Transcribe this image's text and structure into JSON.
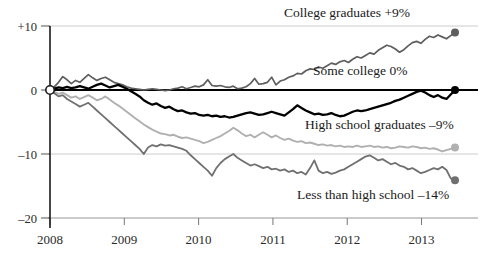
{
  "chart_data": {
    "type": "line",
    "title": "",
    "subtitle": "",
    "xlabel": "",
    "ylabel": "",
    "xlim": [
      2008.0,
      2013.45
    ],
    "ylim": [
      -20,
      10
    ],
    "grid": "horizontal-light",
    "legend_position": "inline-right",
    "zero_line": 0,
    "y_ticks": [
      {
        "value": 10,
        "label": "+10"
      },
      {
        "value": 0,
        "label": "0"
      },
      {
        "value": -10,
        "label": "–10"
      },
      {
        "value": -20,
        "label": "–20"
      }
    ],
    "x_ticks": [
      {
        "value": 2008,
        "label": "2008"
      },
      {
        "value": 2009,
        "label": "2009"
      },
      {
        "value": 2010,
        "label": "2010"
      },
      {
        "value": 2011,
        "label": "2011"
      },
      {
        "value": 2012,
        "label": "2012"
      },
      {
        "value": 2013,
        "label": "2013"
      }
    ],
    "series": [
      {
        "name": "College graduates",
        "label": "College graduates +9%",
        "end_value": 9,
        "end_value_label": "+9%",
        "color": "#5e5e5e",
        "width": 1.7,
        "label_x": 284,
        "label_y": 17,
        "values": [
          0.0,
          0.5,
          1.2,
          2.1,
          1.6,
          1.0,
          1.5,
          1.2,
          1.8,
          2.4,
          1.9,
          1.5,
          1.8,
          2.0,
          1.6,
          1.2,
          1.0,
          0.8,
          0.5,
          0.3,
          0.2,
          0.1,
          0.0,
          0.1,
          0.2,
          0.1,
          0.0,
          -0.1,
          0.0,
          0.2,
          0.3,
          0.5,
          0.2,
          0.4,
          0.6,
          0.5,
          0.8,
          1.6,
          0.7,
          0.6,
          0.7,
          0.5,
          0.4,
          0.6,
          0.2,
          0.3,
          0.5,
          1.0,
          1.8,
          0.9,
          1.0,
          1.2,
          2.0,
          0.8,
          1.4,
          1.6,
          2.0,
          2.2,
          2.6,
          2.5,
          3.0,
          3.3,
          3.2,
          3.6,
          3.4,
          3.8,
          4.2,
          4.0,
          4.4,
          4.6,
          4.3,
          4.8,
          5.2,
          5.0,
          5.4,
          5.8,
          5.6,
          6.2,
          6.6,
          7.0,
          6.8,
          6.4,
          5.9,
          6.3,
          6.9,
          7.4,
          7.6,
          7.3,
          7.9,
          8.4,
          8.2,
          8.6,
          8.3,
          8.0,
          8.5,
          9.0
        ]
      },
      {
        "name": "Some college",
        "label": "Some college 0%",
        "end_value": 0,
        "end_value_label": "0%",
        "color": "#000000",
        "width": 2.3,
        "label_x": 313,
        "label_y": 75,
        "values": [
          0.0,
          0.2,
          0.4,
          0.3,
          0.5,
          0.3,
          0.4,
          0.6,
          0.4,
          0.2,
          0.5,
          0.8,
          1.0,
          0.7,
          0.4,
          0.6,
          0.8,
          0.5,
          0.2,
          -0.2,
          -0.6,
          -1.0,
          -1.6,
          -2.0,
          -2.3,
          -2.1,
          -2.5,
          -2.8,
          -2.6,
          -3.0,
          -3.3,
          -3.2,
          -3.5,
          -3.7,
          -3.6,
          -3.9,
          -4.0,
          -3.9,
          -4.1,
          -4.0,
          -4.2,
          -4.1,
          -4.3,
          -4.2,
          -4.0,
          -3.8,
          -3.6,
          -3.5,
          -3.7,
          -3.9,
          -3.8,
          -3.6,
          -3.4,
          -3.6,
          -3.8,
          -4.0,
          -3.5,
          -3.0,
          -2.4,
          -2.8,
          -3.2,
          -3.5,
          -3.8,
          -3.7,
          -3.9,
          -3.8,
          -3.6,
          -3.9,
          -4.1,
          -4.0,
          -3.7,
          -3.4,
          -3.2,
          -3.3,
          -3.2,
          -3.0,
          -2.8,
          -2.6,
          -2.4,
          -2.2,
          -2.0,
          -1.7,
          -1.5,
          -1.2,
          -0.9,
          -0.6,
          -0.3,
          -0.1,
          -0.4,
          -0.8,
          -1.1,
          -0.8,
          -1.2,
          -1.4,
          -0.7,
          0.0
        ]
      },
      {
        "name": "High school graduates",
        "label": "High school graduates –9%",
        "end_value": -9,
        "end_value_label": "–9%",
        "color": "#b0b0b0",
        "width": 1.9,
        "label_x": 305,
        "label_y": 129,
        "values": [
          0.0,
          -0.3,
          -0.6,
          -0.4,
          -0.8,
          -1.2,
          -1.0,
          -1.4,
          -1.1,
          -0.8,
          -1.2,
          -1.6,
          -1.4,
          -1.0,
          -1.5,
          -2.0,
          -2.4,
          -2.9,
          -3.4,
          -3.9,
          -4.4,
          -4.9,
          -5.4,
          -5.8,
          -6.2,
          -6.5,
          -6.8,
          -6.9,
          -7.1,
          -7.0,
          -7.3,
          -7.5,
          -7.4,
          -7.6,
          -7.8,
          -8.0,
          -8.3,
          -8.1,
          -7.8,
          -7.5,
          -7.2,
          -6.8,
          -6.4,
          -5.9,
          -6.3,
          -6.8,
          -7.2,
          -7.0,
          -7.4,
          -7.0,
          -6.6,
          -7.0,
          -7.4,
          -7.1,
          -7.5,
          -7.8,
          -7.6,
          -7.9,
          -8.1,
          -8.0,
          -8.3,
          -8.2,
          -8.4,
          -8.6,
          -8.5,
          -8.7,
          -8.6,
          -8.8,
          -8.7,
          -8.9,
          -8.8,
          -8.9,
          -8.7,
          -8.9,
          -8.8,
          -8.7,
          -8.9,
          -8.8,
          -9.0,
          -8.9,
          -9.1,
          -9.0,
          -8.8,
          -8.9,
          -9.0,
          -8.8,
          -8.9,
          -9.1,
          -9.0,
          -9.2,
          -9.1,
          -9.3,
          -9.6,
          -9.4,
          -9.2,
          -9.0
        ]
      },
      {
        "name": "Less than high school",
        "label": "Less than high school –14%",
        "end_value": -14,
        "end_value_label": "–14%",
        "color": "#707070",
        "width": 1.8,
        "label_x": 297,
        "label_y": 199,
        "values": [
          0.0,
          -0.5,
          -1.0,
          -0.8,
          -1.4,
          -1.8,
          -2.2,
          -2.6,
          -2.3,
          -2.0,
          -2.6,
          -3.2,
          -3.8,
          -4.4,
          -5.0,
          -5.6,
          -6.2,
          -6.8,
          -7.4,
          -8.0,
          -8.6,
          -9.2,
          -10.0,
          -9.0,
          -8.6,
          -8.8,
          -8.5,
          -8.7,
          -8.6,
          -8.8,
          -9.0,
          -9.2,
          -9.5,
          -10.2,
          -10.8,
          -11.4,
          -12.0,
          -12.6,
          -13.4,
          -12.2,
          -11.4,
          -10.8,
          -10.4,
          -10.0,
          -10.6,
          -11.0,
          -11.4,
          -11.8,
          -11.6,
          -11.9,
          -12.2,
          -12.0,
          -12.4,
          -12.3,
          -12.6,
          -12.4,
          -12.8,
          -12.6,
          -13.0,
          -12.8,
          -13.2,
          -12.2,
          -11.0,
          -12.6,
          -13.0,
          -12.8,
          -13.1,
          -12.9,
          -12.6,
          -12.4,
          -12.0,
          -11.6,
          -11.2,
          -10.8,
          -10.4,
          -10.2,
          -10.6,
          -11.0,
          -10.8,
          -11.2,
          -11.6,
          -11.4,
          -11.8,
          -12.0,
          -12.4,
          -12.2,
          -12.6,
          -13.0,
          -12.8,
          -12.5,
          -12.2,
          -12.4,
          -12.0,
          -12.5,
          -13.8,
          -14.1
        ]
      }
    ],
    "origin_marker": {
      "x": 2008.0,
      "y": 0,
      "style": "open-circle"
    }
  },
  "axis": {
    "y_axis_label_pad": "right-aligned",
    "x_axis_line_color": "#8a8a8a",
    "gridline_color": "#cccccc",
    "zero_line_color": "#000000"
  }
}
